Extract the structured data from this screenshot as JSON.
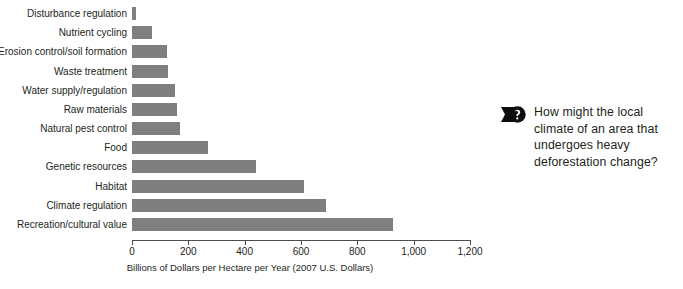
{
  "chart_data": {
    "type": "bar",
    "orientation": "horizontal",
    "title": "",
    "subtitle": "",
    "xlabel": "Billions of Dollars per Hectare per Year (2007 U.S. Dollars)",
    "ylabel": "",
    "xlim": [
      0,
      1200
    ],
    "xticks": [
      0,
      200,
      400,
      600,
      800,
      1000,
      1200
    ],
    "xticklabels": [
      "0",
      "200",
      "400",
      "600",
      "800",
      "1,000",
      "1,200"
    ],
    "grid": false,
    "legend": false,
    "bar_color": "#7f7f7f",
    "categories": [
      "Disturbance regulation",
      "Nutrient cycling",
      "Erosion control/soil formation",
      "Waste treatment",
      "Water supply/regulation",
      "Raw materials",
      "Natural pest control",
      "Food",
      "Genetic resources",
      "Habitat",
      "Climate regulation",
      "Recreation/cultural value"
    ],
    "values": [
      15,
      70,
      125,
      128,
      152,
      160,
      170,
      270,
      440,
      610,
      690,
      925
    ]
  },
  "callout": {
    "icon": "question-banner-icon",
    "text": "How might the local climate of an area that undergoes heavy deforestation change?"
  }
}
